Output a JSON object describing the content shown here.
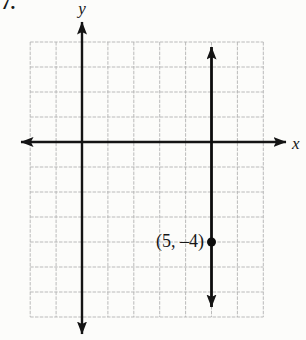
{
  "figure": {
    "problem_number": "7."
  },
  "colors": {
    "background": "#fcfcfa",
    "grid_line": "#b4b4b4",
    "axis": "#141414",
    "plotted_line": "#0d0d0d",
    "point": "#0d0d0d",
    "text": "#161616"
  },
  "chart_data": {
    "type": "line",
    "title": "",
    "grid": {
      "grid_on": true,
      "x_min": -2,
      "x_max": 7,
      "y_min": -7,
      "y_max": 4,
      "unit": 1
    },
    "axes": {
      "x_label": "x",
      "y_label": "y",
      "arrows": "both-ends"
    },
    "series": [
      {
        "name": "vertical line",
        "equation": "x = 5",
        "points_xy": [
          [
            5,
            3.8
          ],
          [
            5,
            -6.6
          ]
        ],
        "arrows_both_ends": true
      }
    ],
    "labeled_points": [
      {
        "x": 5,
        "y": -4,
        "label": "(5, –4)"
      }
    ]
  }
}
